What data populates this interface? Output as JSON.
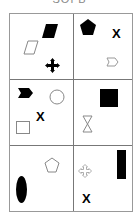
{
  "title": "SOFB",
  "grid": {
    "rows": 3,
    "cols": 2,
    "cells": [
      {
        "id": "r1c1",
        "shapes": [
          "parallelogram-filled",
          "parallelogram-outline",
          "four-arrow-cross-filled"
        ]
      },
      {
        "id": "r1c2",
        "shapes": [
          "pentagon-filled",
          "x-mark",
          "chevron-pentagon-outline"
        ],
        "x_label": "X"
      },
      {
        "id": "r2c1",
        "shapes": [
          "chevron-arrow-filled",
          "circle-outline",
          "x-mark",
          "square-outline"
        ],
        "x_label": "X"
      },
      {
        "id": "r2c2",
        "shapes": [
          "square-filled",
          "hourglass-outline"
        ]
      },
      {
        "id": "r3c1",
        "shapes": [
          "pentagon-outline",
          "ellipse-filled"
        ]
      },
      {
        "id": "r3c2",
        "shapes": [
          "four-arrow-cross-outline",
          "rectangle-filled",
          "x-mark"
        ],
        "x_label": "X"
      }
    ]
  }
}
